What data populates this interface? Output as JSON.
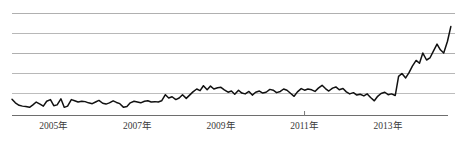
{
  "chart_data": {
    "type": "line",
    "title": "",
    "subtitle": "",
    "xlabel": "",
    "ylabel": "",
    "grid": true,
    "gridlines": 5,
    "legend": "none",
    "axis_color": "#7a7a7a",
    "grid_color": "#b8b8b8",
    "series_color": "#111111",
    "background_color": "#ffffff",
    "xlim": [
      2004.0,
      2014.6
    ],
    "ylim": [
      0,
      5
    ],
    "x_tick_labels": [
      "2005年",
      "2007年",
      "2009年",
      "2011年",
      "2013年"
    ],
    "x_tick_values": [
      2005,
      2007,
      2009,
      2011,
      2013
    ],
    "x_tick_marks": [
      2011
    ],
    "series": [
      {
        "name": "index",
        "x": [
          2004.0,
          2004.08,
          2004.17,
          2004.25,
          2004.33,
          2004.42,
          2004.5,
          2004.58,
          2004.67,
          2004.75,
          2004.83,
          2004.92,
          2005.0,
          2005.08,
          2005.17,
          2005.25,
          2005.33,
          2005.42,
          2005.5,
          2005.58,
          2005.67,
          2005.75,
          2005.83,
          2005.92,
          2006.0,
          2006.08,
          2006.17,
          2006.25,
          2006.33,
          2006.42,
          2006.5,
          2006.58,
          2006.67,
          2006.75,
          2006.83,
          2006.92,
          2007.0,
          2007.08,
          2007.17,
          2007.25,
          2007.33,
          2007.42,
          2007.5,
          2007.58,
          2007.67,
          2007.75,
          2007.83,
          2007.92,
          2008.0,
          2008.08,
          2008.17,
          2008.25,
          2008.33,
          2008.42,
          2008.5,
          2008.58,
          2008.67,
          2008.75,
          2008.83,
          2008.92,
          2009.0,
          2009.08,
          2009.17,
          2009.25,
          2009.33,
          2009.42,
          2009.5,
          2009.58,
          2009.67,
          2009.75,
          2009.83,
          2009.92,
          2010.0,
          2010.08,
          2010.17,
          2010.25,
          2010.33,
          2010.42,
          2010.5,
          2010.58,
          2010.67,
          2010.75,
          2010.83,
          2010.92,
          2011.0,
          2011.08,
          2011.17,
          2011.25,
          2011.33,
          2011.42,
          2011.5,
          2011.58,
          2011.67,
          2011.75,
          2011.83,
          2011.92,
          2012.0,
          2012.08,
          2012.17,
          2012.25,
          2012.33,
          2012.42,
          2012.5,
          2012.58,
          2012.67,
          2012.75,
          2012.83,
          2012.92,
          2013.0,
          2013.08,
          2013.17,
          2013.25,
          2013.33,
          2013.42,
          2013.5,
          2013.58,
          2013.67,
          2013.75,
          2013.83,
          2013.92,
          2014.0,
          2014.08,
          2014.17,
          2014.25,
          2014.33,
          2014.42,
          2014.5
        ],
        "values": [
          0.8,
          0.62,
          0.5,
          0.46,
          0.44,
          0.4,
          0.52,
          0.66,
          0.56,
          0.46,
          0.7,
          0.78,
          0.48,
          0.52,
          0.82,
          0.4,
          0.46,
          0.78,
          0.72,
          0.66,
          0.7,
          0.68,
          0.62,
          0.58,
          0.66,
          0.74,
          0.6,
          0.56,
          0.62,
          0.72,
          0.64,
          0.58,
          0.4,
          0.44,
          0.62,
          0.7,
          0.66,
          0.62,
          0.7,
          0.72,
          0.66,
          0.68,
          0.66,
          0.72,
          1.02,
          0.86,
          0.92,
          0.78,
          0.86,
          1.02,
          0.84,
          1.0,
          1.16,
          1.3,
          1.22,
          1.46,
          1.26,
          1.44,
          1.3,
          1.36,
          1.38,
          1.26,
          1.14,
          1.2,
          1.04,
          1.24,
          1.1,
          1.06,
          1.18,
          1.0,
          1.14,
          1.2,
          1.1,
          1.14,
          1.28,
          1.24,
          1.12,
          1.18,
          1.3,
          1.24,
          1.08,
          0.94,
          1.16,
          1.32,
          1.24,
          1.3,
          1.26,
          1.18,
          1.34,
          1.48,
          1.32,
          1.2,
          1.34,
          1.4,
          1.26,
          1.32,
          1.16,
          1.06,
          1.12,
          1.0,
          1.04,
          0.96,
          1.06,
          0.88,
          0.72,
          0.94,
          1.08,
          1.14,
          1.02,
          1.06,
          0.98,
          1.92,
          2.06,
          1.84,
          2.1,
          2.42,
          2.7,
          2.56,
          3.06,
          2.72,
          2.82,
          3.14,
          3.5,
          3.22,
          3.06,
          3.64,
          4.36
        ]
      }
    ]
  }
}
